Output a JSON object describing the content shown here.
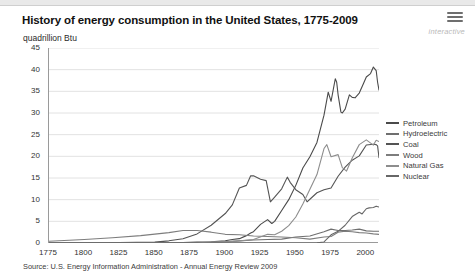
{
  "header": {
    "title": "History of energy consumption in the United States, 1775-2009",
    "subtitle": "quadrillion Btu",
    "interactive_label": "interactive",
    "menu_icon": "hamburger-icon"
  },
  "source": "Source: U.S. Energy Information Administration - Annual Energy Review 2009",
  "chart_data": {
    "type": "line",
    "title": "History of energy consumption in the United States, 1775-2009",
    "xlabel": "",
    "ylabel": "quadrillion Btu",
    "xlim": [
      1775,
      2009
    ],
    "ylim": [
      0,
      45
    ],
    "xticks": [
      1775,
      1800,
      1825,
      1850,
      1875,
      1900,
      1925,
      1950,
      1975,
      2000
    ],
    "yticks": [
      0,
      5,
      10,
      15,
      20,
      25,
      30,
      35,
      40,
      45
    ],
    "grid": "horizontal",
    "legend_position": "right",
    "colors": {
      "petroleum": "#4a4a4a",
      "hydroelectric": "#6f6f6f",
      "coal": "#545454",
      "wood": "#7d7d7d",
      "natural_gas": "#8d8d8d",
      "nuclear": "#676767",
      "gridline": "#e2e2e2",
      "axis": "#9a9a9a"
    },
    "series": [
      {
        "name": "Petroleum",
        "color": "#4a4a4a",
        "x": [
          1775,
          1850,
          1860,
          1870,
          1880,
          1890,
          1900,
          1905,
          1910,
          1915,
          1918,
          1920,
          1925,
          1930,
          1933,
          1935,
          1940,
          1945,
          1950,
          1955,
          1960,
          1965,
          1970,
          1973,
          1975,
          1978,
          1979,
          1980,
          1982,
          1983,
          1985,
          1988,
          1990,
          1992,
          1995,
          1998,
          2000,
          2003,
          2005,
          2007,
          2008,
          2009
        ],
        "values": [
          0,
          0,
          0.1,
          0.1,
          0.2,
          0.3,
          0.5,
          0.8,
          1.0,
          1.7,
          2.3,
          2.6,
          4.3,
          5.4,
          4.5,
          5.0,
          7.5,
          10.0,
          13.3,
          17.3,
          19.9,
          23.2,
          29.5,
          34.8,
          32.7,
          37.9,
          37.1,
          34.2,
          30.2,
          30.0,
          30.9,
          34.2,
          33.6,
          33.5,
          34.6,
          36.8,
          38.3,
          39.1,
          40.6,
          39.8,
          37.1,
          35.3
        ]
      },
      {
        "name": "Hydroelectric",
        "color": "#6f6f6f",
        "x": [
          1775,
          1880,
          1890,
          1900,
          1910,
          1920,
          1930,
          1940,
          1950,
          1960,
          1970,
          1975,
          1980,
          1985,
          1990,
          1995,
          2000,
          2005,
          2009
        ],
        "values": [
          0,
          0,
          0.02,
          0.25,
          0.5,
          0.7,
          0.8,
          0.9,
          1.4,
          1.6,
          2.6,
          3.2,
          2.9,
          2.9,
          3.0,
          3.2,
          2.8,
          2.7,
          2.7
        ]
      },
      {
        "name": "Coal",
        "color": "#545454",
        "x": [
          1775,
          1800,
          1825,
          1850,
          1860,
          1870,
          1880,
          1890,
          1900,
          1905,
          1910,
          1915,
          1918,
          1920,
          1925,
          1929,
          1932,
          1935,
          1940,
          1944,
          1946,
          1950,
          1955,
          1958,
          1960,
          1965,
          1970,
          1975,
          1980,
          1985,
          1990,
          1995,
          2000,
          2005,
          2007,
          2008,
          2009
        ],
        "values": [
          0,
          0.02,
          0.1,
          0.2,
          0.5,
          1.0,
          2.1,
          4.1,
          6.8,
          8.8,
          12.7,
          13.3,
          15.5,
          15.5,
          14.7,
          14.4,
          9.5,
          10.6,
          12.5,
          15.2,
          14.0,
          12.3,
          11.2,
          9.5,
          10.1,
          11.6,
          12.3,
          12.7,
          15.4,
          17.5,
          19.1,
          20.1,
          22.6,
          22.8,
          22.7,
          22.4,
          19.7
        ]
      },
      {
        "name": "Wood",
        "color": "#7d7d7d",
        "x": [
          1775,
          1800,
          1820,
          1840,
          1860,
          1870,
          1880,
          1890,
          1900,
          1910,
          1920,
          1930,
          1940,
          1950,
          1960,
          1970,
          1975,
          1980,
          1985,
          1990,
          1995,
          2000,
          2005,
          2009
        ],
        "values": [
          0.4,
          0.8,
          1.2,
          1.7,
          2.4,
          2.9,
          2.9,
          2.5,
          2.0,
          1.9,
          1.6,
          1.5,
          1.4,
          1.2,
          0.9,
          1.4,
          1.5,
          2.5,
          2.7,
          2.6,
          2.4,
          2.3,
          2.1,
          2.0
        ]
      },
      {
        "name": "Natural Gas",
        "color": "#8d8d8d",
        "x": [
          1775,
          1880,
          1890,
          1900,
          1910,
          1920,
          1930,
          1935,
          1940,
          1945,
          1950,
          1955,
          1960,
          1965,
          1970,
          1972,
          1975,
          1980,
          1983,
          1986,
          1990,
          1995,
          2000,
          2005,
          2007,
          2009
        ],
        "values": [
          0,
          0,
          0.25,
          0.25,
          0.5,
          0.8,
          2.0,
          1.9,
          2.7,
          4.0,
          6.0,
          9.0,
          12.4,
          15.8,
          21.8,
          22.7,
          19.9,
          20.4,
          17.4,
          16.6,
          19.6,
          22.7,
          23.8,
          22.6,
          23.7,
          23.4
        ]
      },
      {
        "name": "Nuclear",
        "color": "#676767",
        "x": [
          1775,
          1957,
          1965,
          1970,
          1975,
          1980,
          1985,
          1990,
          1992,
          1995,
          1997,
          2000,
          2002,
          2005,
          2007,
          2009
        ],
        "values": [
          0,
          0,
          0.04,
          0.24,
          1.9,
          2.7,
          4.1,
          6.1,
          6.5,
          7.1,
          6.7,
          7.9,
          8.1,
          8.2,
          8.5,
          8.3
        ]
      }
    ],
    "legend": [
      "Petroleum",
      "Hydroelectric",
      "Coal",
      "Wood",
      "Natural Gas",
      "Nuclear"
    ]
  }
}
